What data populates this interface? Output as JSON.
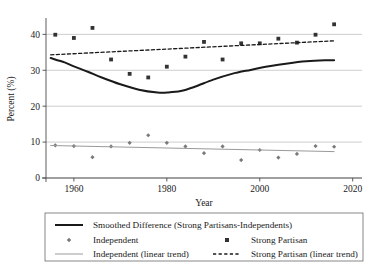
{
  "chart_data": {
    "type": "scatter",
    "title": "",
    "xlabel": "Year",
    "ylabel": "Percent (%)",
    "xlim": [
      1954,
      2022
    ],
    "ylim": [
      0,
      44
    ],
    "xticks": [
      1960,
      1980,
      2000,
      2020
    ],
    "yticks": [
      0,
      10,
      20,
      30,
      40
    ],
    "grid": "horizontal",
    "legend_position": "below-plot",
    "series": [
      {
        "name": "Smoothed Difference (Strong Partisans-Independents)",
        "type": "line",
        "style": "solid",
        "color": "#1a1a1a",
        "width": 2.0,
        "x": [
          1955,
          1958,
          1960,
          1963,
          1966,
          1970,
          1974,
          1978,
          1980,
          1983,
          1986,
          1990,
          1994,
          1998,
          2002,
          2006,
          2010,
          2014,
          2016
        ],
        "y": [
          33.4,
          32.2,
          31.1,
          29.6,
          28.0,
          26.1,
          24.6,
          23.8,
          23.8,
          24.2,
          25.4,
          27.4,
          29.0,
          30.1,
          31.1,
          31.9,
          32.5,
          32.8,
          32.8
        ]
      },
      {
        "name": "Independent",
        "type": "scatter",
        "marker": "small-diamond",
        "color": "#7a7a7a",
        "x": [
          1956,
          1960,
          1964,
          1968,
          1972,
          1976,
          1980,
          1984,
          1988,
          1992,
          1996,
          2000,
          2004,
          2008,
          2012,
          2016
        ],
        "y": [
          9.1,
          8.9,
          5.8,
          8.8,
          9.8,
          11.9,
          9.8,
          8.8,
          6.9,
          8.8,
          5.0,
          7.8,
          5.7,
          6.7,
          8.9,
          8.7
        ]
      },
      {
        "name": "Strong Partisan",
        "type": "scatter",
        "marker": "square",
        "color": "#333333",
        "x": [
          1956,
          1960,
          1964,
          1968,
          1972,
          1976,
          1980,
          1984,
          1988,
          1992,
          1996,
          2000,
          2004,
          2008,
          2012,
          2016
        ],
        "y": [
          39.9,
          39.0,
          41.8,
          33.0,
          29.0,
          28.0,
          31.0,
          33.8,
          37.9,
          33.0,
          37.5,
          37.5,
          38.8,
          37.7,
          39.9,
          42.8
        ]
      },
      {
        "name": "Independent (linear trend)",
        "type": "line",
        "style": "solid",
        "color": "#9a9a9a",
        "width": 1.0,
        "x": [
          1955,
          2016
        ],
        "y": [
          9.05,
          7.35
        ]
      },
      {
        "name": "Strong Partisan (linear trend)",
        "type": "line",
        "style": "dashed",
        "color": "#1a1a1a",
        "width": 1.3,
        "x": [
          1955,
          2016
        ],
        "y": [
          34.3,
          38.2
        ]
      }
    ],
    "xtick_labels": [
      "1960",
      "1980",
      "2000",
      "2020"
    ],
    "ytick_labels": [
      "0",
      "10",
      "20",
      "30",
      "40"
    ]
  },
  "legend": {
    "rows": [
      {
        "items": [
          {
            "label": "Smoothed Difference (Strong Partisans-Independents)",
            "key": "smoothed-difference"
          }
        ]
      },
      {
        "items": [
          {
            "label": "Independent",
            "key": "independent"
          },
          {
            "label": "Strong Partisan",
            "key": "strong-partisan"
          }
        ]
      },
      {
        "items": [
          {
            "label": "Independent (linear trend)",
            "key": "independent-trend"
          },
          {
            "label": "Strong Partisan (linear trend)",
            "key": "strong-partisan-trend"
          }
        ]
      }
    ]
  },
  "colors": {
    "axis": "#4a4a4a",
    "grid": "#b8b8b8",
    "solid_line": "#1a1a1a",
    "independent_marker": "#7a7a7a",
    "partisan_marker": "#333333",
    "independent_trend": "#9a9a9a",
    "legend_border": "#6a6a6a",
    "background": "#ffffff"
  }
}
